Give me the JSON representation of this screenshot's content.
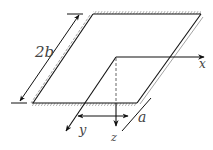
{
  "diagram": {
    "labels": {
      "width": "2b",
      "x_axis": "x",
      "y_axis": "y",
      "z_axis": "z",
      "distance": "a"
    },
    "colors": {
      "line": "#111111",
      "hatch": "#555555",
      "label": "#444444"
    }
  }
}
